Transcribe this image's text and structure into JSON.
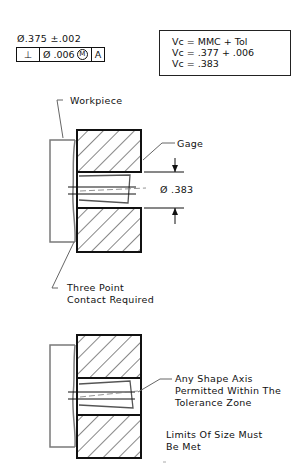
{
  "tolerance": {
    "size_callout": "Ø.375 ±.002",
    "fcf": {
      "symbol": "⊥",
      "tolerance": "Ø .006",
      "modifier": "M",
      "datum": "A"
    }
  },
  "virtual_condition": {
    "lines": [
      "Vc  =  MMC  +  Tol",
      "Vc  =  .377  +  .006",
      "Vc  =  .383"
    ]
  },
  "labels": {
    "workpiece": "Workpiece",
    "gage": "Gage",
    "gage_diameter": "Ø .383",
    "three_point_1": "Three Point",
    "three_point_2": "Contact Required",
    "any_shape_1": "Any Shape Axis",
    "any_shape_2": "Permitted Within The",
    "any_shape_3": "Tolerance Zone",
    "limits_1": "Limits Of Size Must",
    "limits_2": "Be Met"
  },
  "colors": {
    "line": "#111111",
    "workpiece": "#7a7a7a",
    "leader": "#666666"
  }
}
